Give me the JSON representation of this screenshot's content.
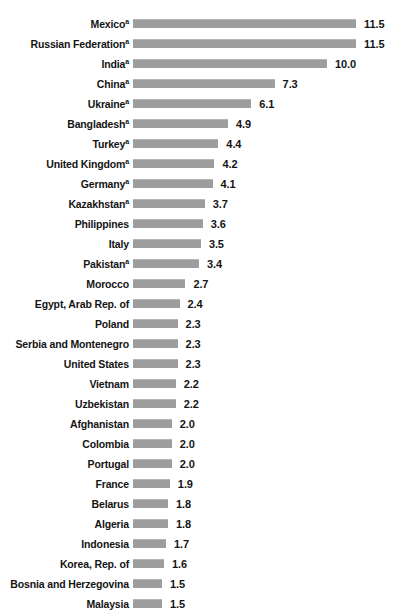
{
  "chart_data": {
    "type": "bar",
    "orientation": "horizontal",
    "title": "",
    "xlabel": "",
    "ylabel": "",
    "xlim": [
      0,
      11.5
    ],
    "grid": false,
    "legend": null,
    "bar_color": "#9d9d9d",
    "label_color": "#141414",
    "value_format": "one-decimal",
    "footnote_marker": "a",
    "categories": [
      "Mexico",
      "Russian Federation",
      "India",
      "China",
      "Ukraine",
      "Bangladesh",
      "Turkey",
      "United Kingdom",
      "Germany",
      "Kazakhstan",
      "Philippines",
      "Italy",
      "Pakistan",
      "Morocco",
      "Egypt, Arab Rep. of",
      "Poland",
      "Serbia and Montenegro",
      "United States",
      "Vietnam",
      "Uzbekistan",
      "Afghanistan",
      "Colombia",
      "Portugal",
      "France",
      "Belarus",
      "Algeria",
      "Indonesia",
      "Korea, Rep. of",
      "Bosnia and Herzegovina",
      "Malaysia"
    ],
    "values": [
      11.5,
      11.5,
      10.0,
      7.3,
      6.1,
      4.9,
      4.4,
      4.2,
      4.1,
      3.7,
      3.6,
      3.5,
      3.4,
      2.7,
      2.4,
      2.3,
      2.3,
      2.3,
      2.2,
      2.2,
      2.0,
      2.0,
      2.0,
      1.9,
      1.8,
      1.8,
      1.7,
      1.6,
      1.5,
      1.5
    ],
    "rows": [
      {
        "label": "Mexico",
        "sup": "a",
        "value": 11.5,
        "value_text": "11.5"
      },
      {
        "label": "Russian Federation",
        "sup": "a",
        "value": 11.5,
        "value_text": "11.5"
      },
      {
        "label": "India",
        "sup": "a",
        "value": 10.0,
        "value_text": "10.0"
      },
      {
        "label": "China",
        "sup": "a",
        "value": 7.3,
        "value_text": "7.3"
      },
      {
        "label": "Ukraine",
        "sup": "a",
        "value": 6.1,
        "value_text": "6.1"
      },
      {
        "label": "Bangladesh",
        "sup": "a",
        "value": 4.9,
        "value_text": "4.9"
      },
      {
        "label": "Turkey",
        "sup": "a",
        "value": 4.4,
        "value_text": "4.4"
      },
      {
        "label": "United Kingdom",
        "sup": "a",
        "value": 4.2,
        "value_text": "4.2"
      },
      {
        "label": "Germany",
        "sup": "a",
        "value": 4.1,
        "value_text": "4.1"
      },
      {
        "label": "Kazakhstan",
        "sup": "a",
        "value": 3.7,
        "value_text": "3.7"
      },
      {
        "label": "Philippines",
        "sup": "",
        "value": 3.6,
        "value_text": "3.6"
      },
      {
        "label": "Italy",
        "sup": "",
        "value": 3.5,
        "value_text": "3.5"
      },
      {
        "label": "Pakistan",
        "sup": "a",
        "value": 3.4,
        "value_text": "3.4"
      },
      {
        "label": "Morocco",
        "sup": "",
        "value": 2.7,
        "value_text": "2.7"
      },
      {
        "label": "Egypt, Arab Rep. of",
        "sup": "",
        "value": 2.4,
        "value_text": "2.4"
      },
      {
        "label": "Poland",
        "sup": "",
        "value": 2.3,
        "value_text": "2.3"
      },
      {
        "label": "Serbia and Montenegro",
        "sup": "",
        "value": 2.3,
        "value_text": "2.3"
      },
      {
        "label": "United States",
        "sup": "",
        "value": 2.3,
        "value_text": "2.3"
      },
      {
        "label": "Vietnam",
        "sup": "",
        "value": 2.2,
        "value_text": "2.2"
      },
      {
        "label": "Uzbekistan",
        "sup": "",
        "value": 2.2,
        "value_text": "2.2"
      },
      {
        "label": "Afghanistan",
        "sup": "",
        "value": 2.0,
        "value_text": "2.0"
      },
      {
        "label": "Colombia",
        "sup": "",
        "value": 2.0,
        "value_text": "2.0"
      },
      {
        "label": "Portugal",
        "sup": "",
        "value": 2.0,
        "value_text": "2.0"
      },
      {
        "label": "France",
        "sup": "",
        "value": 1.9,
        "value_text": "1.9"
      },
      {
        "label": "Belarus",
        "sup": "",
        "value": 1.8,
        "value_text": "1.8"
      },
      {
        "label": "Algeria",
        "sup": "",
        "value": 1.8,
        "value_text": "1.8"
      },
      {
        "label": "Indonesia",
        "sup": "",
        "value": 1.7,
        "value_text": "1.7"
      },
      {
        "label": "Korea, Rep. of",
        "sup": "",
        "value": 1.6,
        "value_text": "1.6"
      },
      {
        "label": "Bosnia and Herzegovina",
        "sup": "",
        "value": 1.5,
        "value_text": "1.5"
      },
      {
        "label": "Malaysia",
        "sup": "",
        "value": 1.5,
        "value_text": "1.5"
      }
    ]
  },
  "render": {
    "px_per_unit": 19.4,
    "value_gap_px": 8
  }
}
